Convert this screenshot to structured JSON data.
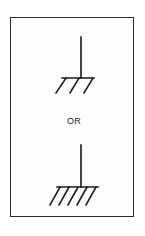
{
  "diagram": {
    "title": "",
    "separator_text": "OR",
    "frame": {
      "border_color": "#2a2a2a",
      "background": "#ffffff"
    },
    "symbols": [
      {
        "name": "ground-symbol-3-hatch",
        "description": "Ground symbol with vertical lead and three slanted hatch lines",
        "hatch_count": 3
      },
      {
        "name": "ground-symbol-5-hatch",
        "description": "Ground symbol with vertical lead and five slanted hatch lines",
        "hatch_count": 5
      }
    ],
    "stroke_color": "#1a1a1a"
  }
}
